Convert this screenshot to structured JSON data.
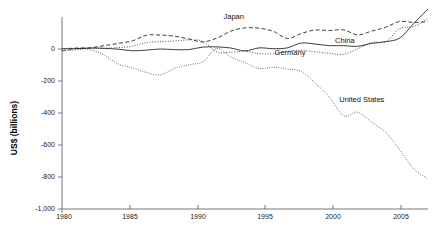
{
  "chart_data": {
    "type": "line",
    "title": "",
    "xlabel": "",
    "ylabel": "US$ (billions)",
    "xlim": [
      1980,
      2006
    ],
    "ylim": [
      -1000,
      200
    ],
    "grid": false,
    "legend_position": "inline-annotations",
    "x_ticks": [
      "1980",
      "1985",
      "1990",
      "1995",
      "2000",
      "2005"
    ],
    "x_tick_values": [
      1980,
      1985,
      1990,
      1995,
      2000,
      2005
    ],
    "y_ticks": [
      "0",
      "-200",
      "-400",
      "-600",
      "-800",
      "-1,000"
    ],
    "y_tick_values": [
      0,
      -200,
      -400,
      -600,
      -800,
      -1000
    ],
    "x": [
      1980,
      1981,
      1982,
      1983,
      1984,
      1985,
      1986,
      1987,
      1988,
      1989,
      1990,
      1991,
      1992,
      1993,
      1994,
      1995,
      1996,
      1997,
      1998,
      1999,
      2000,
      2001,
      2002,
      2003,
      2004,
      2005,
      2006
    ],
    "series": [
      {
        "name": "Japan",
        "style": "dashed",
        "label": "Japan",
        "values": [
          -11,
          5,
          7,
          21,
          35,
          51,
          86,
          87,
          80,
          63,
          44,
          68,
          112,
          132,
          130,
          111,
          66,
          97,
          119,
          115,
          120,
          88,
          112,
          136,
          172,
          166,
          171
        ]
      },
      {
        "name": "China",
        "style": "solid",
        "label": "China",
        "values": [
          2,
          2,
          6,
          4,
          -1,
          -11,
          -7,
          0,
          -4,
          -4,
          12,
          13,
          6,
          -12,
          7,
          2,
          7,
          37,
          31,
          21,
          21,
          17,
          35,
          46,
          69,
          161,
          250
        ]
      },
      {
        "name": "Germany",
        "style": "dot-dash",
        "label": "Germany",
        "values": [
          -13,
          -5,
          5,
          5,
          9,
          17,
          40,
          46,
          50,
          57,
          48,
          -19,
          -20,
          -14,
          -29,
          -30,
          -14,
          -9,
          -17,
          -27,
          -33,
          1,
          41,
          46,
          128,
          141,
          190
        ]
      },
      {
        "name": "United States",
        "style": "dotted",
        "label": "United States",
        "values": [
          2,
          5,
          -5,
          -38,
          -94,
          -118,
          -147,
          -161,
          -121,
          -99,
          -79,
          3,
          -50,
          -85,
          -122,
          -114,
          -125,
          -141,
          -215,
          -301,
          -417,
          -395,
          -458,
          -521,
          -631,
          -749,
          -811
        ]
      }
    ],
    "annotations": [
      {
        "text": "Japan",
        "x": 1992.2,
        "y": 185
      },
      {
        "text": "China",
        "x": 2000.1,
        "y": 40
      },
      {
        "text": "Germany",
        "x": 1996.2,
        "y": -35
      },
      {
        "text": "United States",
        "x": 2001.3,
        "y": -330
      }
    ]
  },
  "axis": {
    "ylabel": "US$ (billions)"
  }
}
